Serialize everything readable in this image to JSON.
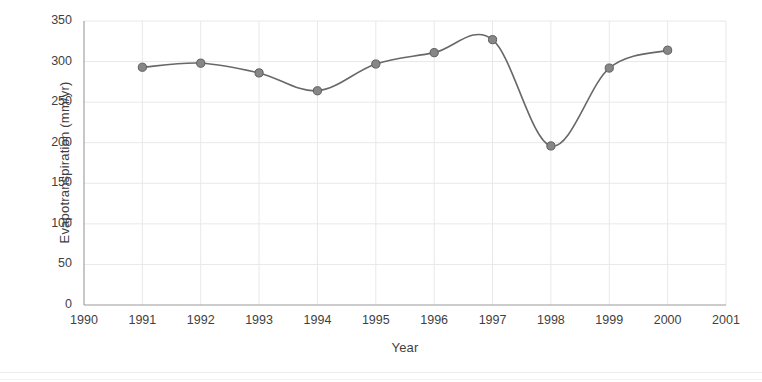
{
  "chart_data": {
    "type": "line",
    "title": "",
    "subtitle": "",
    "xlabel": "Year",
    "ylabel": "Evapotranspiration (mm/yr)",
    "x": [
      1991,
      1992,
      1993,
      1994,
      1995,
      1996,
      1997,
      1998,
      1999,
      2000
    ],
    "values": [
      293,
      298,
      286,
      264,
      297,
      311,
      327,
      196,
      292,
      314
    ],
    "series": [
      {
        "name": "Evapotranspiration",
        "values": [
          293,
          298,
          286,
          264,
          297,
          311,
          327,
          196,
          292,
          314
        ]
      }
    ],
    "xlim": [
      1990,
      2001
    ],
    "ylim": [
      0,
      350
    ],
    "xticks": [
      1990,
      1991,
      1992,
      1993,
      1994,
      1995,
      1996,
      1997,
      1998,
      1999,
      2000,
      2001
    ],
    "xtick_labels": [
      "1990",
      "1991",
      "1992",
      "1993",
      "1994",
      "1995",
      "1996",
      "1997",
      "1998",
      "1999",
      "2000",
      "2001"
    ],
    "yticks": [
      0,
      50,
      100,
      150,
      200,
      250,
      300,
      350
    ],
    "ytick_labels": [
      "0",
      "50",
      "100",
      "150",
      "200",
      "250",
      "300",
      "350"
    ],
    "grid": true,
    "grid_color": "#e8e8e8",
    "legend": false,
    "legend_position": "none",
    "line_color": "#686868",
    "marker_color": "#878787",
    "marker_edge_color": "#5e5e5e",
    "marker_shape": "circle",
    "line_style": "smooth",
    "background_color": "#ffffff",
    "axis_color": "#9a9a9a"
  }
}
